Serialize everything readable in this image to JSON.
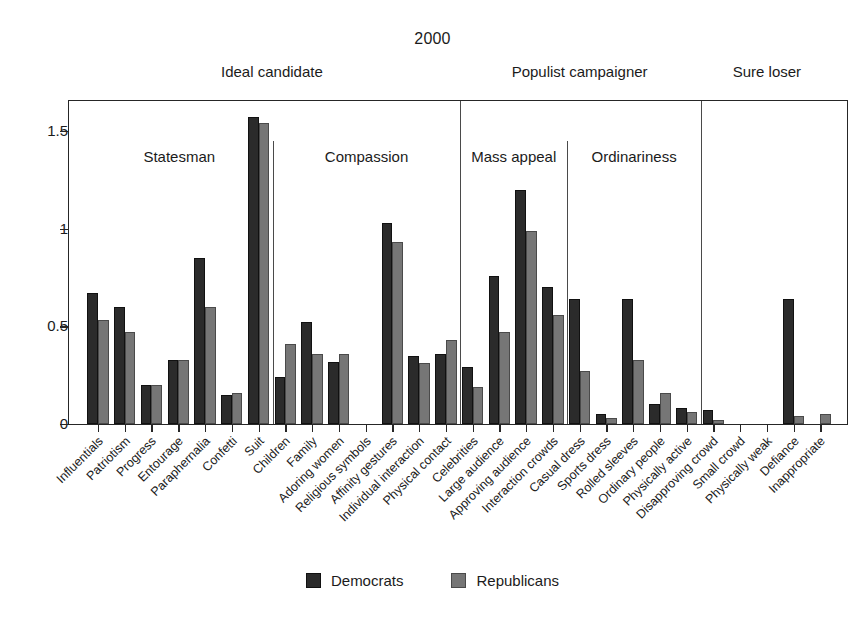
{
  "chart_data": {
    "type": "bar",
    "title": "2000",
    "xlabel": "",
    "ylabel": "",
    "ylim": [
      0,
      1.7
    ],
    "yticks": [
      0,
      0.5,
      1,
      1.5
    ],
    "ytick_labels": [
      "0",
      "0.5",
      "1",
      "1.5"
    ],
    "grid": false,
    "legend_position": "bottom-center",
    "series": [
      {
        "name": "Democrats",
        "color": "#2b2b2b",
        "values": [
          0.67,
          0.6,
          0.2,
          0.33,
          0.85,
          0.15,
          1.57,
          0.24,
          0.52,
          0.32,
          0.0,
          1.03,
          0.35,
          0.36,
          0.29,
          0.76,
          1.2,
          0.7,
          0.64,
          0.05,
          0.64,
          0.1,
          0.08,
          0.07,
          0.0,
          0.0,
          0.64,
          0.0
        ]
      },
      {
        "name": "Republicans",
        "color": "#767676",
        "values": [
          0.53,
          0.47,
          0.2,
          0.33,
          0.6,
          0.16,
          1.54,
          0.41,
          0.36,
          0.36,
          0.0,
          0.93,
          0.31,
          0.43,
          0.19,
          0.47,
          0.99,
          0.56,
          0.27,
          0.03,
          0.33,
          0.16,
          0.06,
          0.02,
          0.0,
          0.0,
          0.04,
          0.05
        ]
      }
    ],
    "categories": [
      "Influentials",
      "Patriotism",
      "Progress",
      "Entourage",
      "Paraphernalia",
      "Confetti",
      "Suit",
      "Children",
      "Family",
      "Adoring women",
      "Religious symbols",
      "Affinity gestures",
      "Individual interaction",
      "Physical contact",
      "Celebrities",
      "Large audience",
      "Approving audience",
      "Interaction crowds",
      "Casual dress",
      "Sports dress",
      "Rolled sleeves",
      "Ordinary people",
      "Physically active",
      "Disapproving crowd",
      "Small crowd",
      "Physically weak",
      "Defiance",
      "Inappropriate"
    ],
    "groups": [
      {
        "label": "Statesman",
        "start": 0,
        "count": 7
      },
      {
        "label": "Compassion",
        "start": 7,
        "count": 7
      },
      {
        "label": "Mass appeal",
        "start": 14,
        "count": 4
      },
      {
        "label": "Ordinariness",
        "start": 18,
        "count": 5
      },
      {
        "label": "",
        "start": 23,
        "count": 5
      }
    ],
    "supergroups": [
      {
        "label": "Ideal candidate",
        "start": 0,
        "count": 14
      },
      {
        "label": "Populist campaigner",
        "start": 14,
        "count": 9
      },
      {
        "label": "Sure loser",
        "start": 23,
        "count": 5
      }
    ]
  },
  "legend": {
    "items": [
      {
        "label": "Democrats",
        "color": "#2b2b2b"
      },
      {
        "label": "Republicans",
        "color": "#767676"
      }
    ]
  }
}
